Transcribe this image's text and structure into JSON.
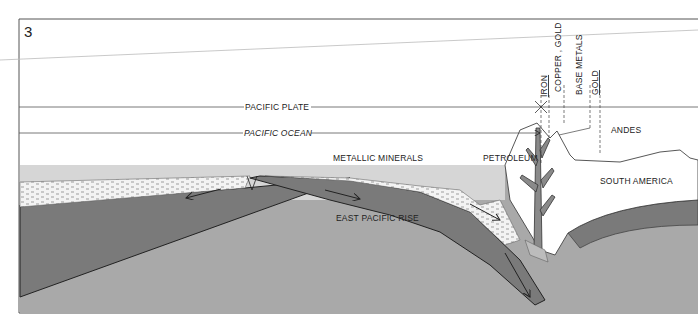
{
  "figure": {
    "number": "3",
    "type": "cross-section diagram"
  },
  "labels": {
    "pacific_plate": "PACIFIC PLATE",
    "pacific_ocean": "PACIFIC OCEAN",
    "metallic_minerals": "METALLIC MINERALS",
    "petroleum": "PETROLEUM",
    "east_pacific_rise": "EAST PACIFIC RISE",
    "south_america": "SOUTH AMERICA",
    "andes": "ANDES",
    "iron": "IRON",
    "copper_gold": "COPPER , GOLD",
    "base_metals": "BASE METALS",
    "gold": "GOLD"
  },
  "colors": {
    "background": "#ffffff",
    "ocean_water": "#d6d6d6",
    "sediment": "#f2f2f2",
    "oceanic_plate": "#7a7a7a",
    "mantle": "#a9a9a9",
    "continent": "#ffffff",
    "magma_tree": "#8a8a8a",
    "line": "#333333"
  }
}
